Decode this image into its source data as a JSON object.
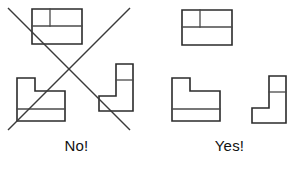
{
  "figure": {
    "width": 306,
    "height": 172,
    "background_color": "#ffffff",
    "line_color": "#2b2b2b",
    "inner_line_color": "#4a4a4a",
    "cross_color": "#3a3a3a",
    "text_color": "#111111"
  },
  "panels": {
    "no": {
      "caption": "No!",
      "marked_incorrect": true,
      "cross_mark": {
        "name": "red-x-cross",
        "line_a": {
          "x1": 8,
          "y1": 8,
          "x2": 130,
          "y2": 130
        },
        "line_b": {
          "x1": 130,
          "y1": 8,
          "x2": 8,
          "y2": 130
        }
      },
      "views": [
        {
          "name": "top-view",
          "label": "rectangle-with-divisions",
          "outline": "M 32 9 L 82 9 L 82 44 L 32 44 Z",
          "inner_lines": [
            "M 32 26 L 82 26",
            "M 50 9 L 50 26"
          ]
        },
        {
          "name": "front-view",
          "label": "stepped-block",
          "outline": "M 17 78 L 35 78 L 35 91 L 65 91 L 65 121 L 17 121 Z",
          "inner_lines": [
            "M 17 109 L 65 109"
          ]
        },
        {
          "name": "side-view",
          "label": "boot-shape",
          "outline": "M 116 64 L 133 64 L 133 111 L 99 111 L 99 96 L 116 96 Z",
          "inner_lines": [
            "M 116 80 L 133 80"
          ]
        }
      ]
    },
    "yes": {
      "caption": "Yes!",
      "marked_incorrect": false,
      "views": [
        {
          "name": "top-view",
          "label": "rectangle-with-divisions",
          "outline": "M 182 10 L 232 10 L 232 45 L 182 45 Z",
          "inner_lines": [
            "M 182 27 L 232 27",
            "M 200 10 L 200 27"
          ]
        },
        {
          "name": "front-view",
          "label": "stepped-block",
          "outline": "M 172 78 L 190 78 L 190 91 L 220 91 L 220 121 L 172 121 Z",
          "inner_lines": [
            "M 172 109 L 220 109"
          ]
        },
        {
          "name": "side-view",
          "label": "boot-shape",
          "outline": "M 269 76 L 286 76 L 286 123 L 252 123 L 252 108 L 269 108 Z",
          "inner_lines": [
            "M 269 92 L 286 92"
          ]
        }
      ]
    }
  }
}
